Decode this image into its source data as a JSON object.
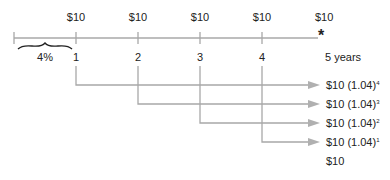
{
  "diagram": {
    "payments": [
      "$10",
      "$10",
      "$10",
      "$10",
      "$10"
    ],
    "rate_label": "4%",
    "periods": [
      "1",
      "2",
      "3",
      "4"
    ],
    "end_label": "5 years",
    "end_marker": "*",
    "compounded_values": [
      {
        "base": "$10 (1.04)",
        "exp": "4"
      },
      {
        "base": "$10 (1.04)",
        "exp": "3"
      },
      {
        "base": "$10 (1.04)",
        "exp": "2"
      },
      {
        "base": "$10 (1.04)",
        "exp": "1"
      }
    ],
    "final_value": "$10",
    "colors": {
      "line": "#a8a8a8",
      "arrow": "#b0b0b0",
      "text": "#222222"
    }
  }
}
